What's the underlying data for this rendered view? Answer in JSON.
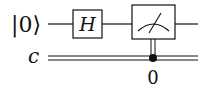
{
  "diagram": {
    "type": "quantum-circuit",
    "qubits": [
      {
        "label": "|0⟩",
        "gates": [
          "H",
          "measure"
        ]
      }
    ],
    "classical_bits": [
      {
        "label": "c"
      }
    ],
    "gates": [
      {
        "name": "H",
        "label": "H",
        "wire": "q0"
      },
      {
        "name": "measure",
        "label": "",
        "wire": "q0",
        "target": "c",
        "bit_index_label": "0"
      }
    ],
    "colors": {
      "line": "#111111",
      "background": "#ffffff"
    }
  }
}
